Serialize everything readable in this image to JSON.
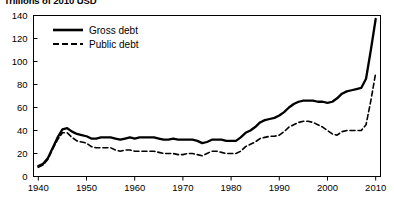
{
  "chart_data": {
    "type": "line",
    "title": "Trillions of 2010 USD",
    "xlabel": "",
    "ylabel": "",
    "xlim": [
      1939,
      2011
    ],
    "ylim": [
      0,
      140
    ],
    "grid": false,
    "legend_position": "top-left-inside",
    "x_ticks": [
      "1940",
      "1950",
      "1960",
      "1970",
      "1980",
      "1990",
      "2000",
      "2010"
    ],
    "x_tick_values": [
      1940,
      1950,
      1960,
      1970,
      1980,
      1990,
      2000,
      2010
    ],
    "y_ticks": [
      "0",
      "20",
      "40",
      "60",
      "80",
      "100",
      "120",
      "140"
    ],
    "y_tick_values": [
      0,
      20,
      40,
      60,
      80,
      100,
      120,
      140
    ],
    "x": [
      1940,
      1941,
      1942,
      1943,
      1944,
      1945,
      1946,
      1947,
      1948,
      1949,
      1950,
      1951,
      1952,
      1953,
      1954,
      1955,
      1956,
      1957,
      1958,
      1959,
      1960,
      1961,
      1962,
      1963,
      1964,
      1965,
      1966,
      1967,
      1968,
      1969,
      1970,
      1971,
      1972,
      1973,
      1974,
      1975,
      1976,
      1977,
      1978,
      1979,
      1980,
      1981,
      1982,
      1983,
      1984,
      1985,
      1986,
      1987,
      1988,
      1989,
      1990,
      1991,
      1992,
      1993,
      1994,
      1995,
      1996,
      1997,
      1998,
      1999,
      2000,
      2001,
      2002,
      2003,
      2004,
      2005,
      2006,
      2007,
      2008,
      2009,
      2010
    ],
    "series": [
      {
        "name": "Gross debt",
        "style": "solid",
        "color": "#000000",
        "values": [
          9,
          11,
          16,
          25,
          34,
          41,
          42,
          39,
          37,
          36,
          35,
          33,
          33,
          34,
          34,
          34,
          33,
          32,
          33,
          34,
          33,
          34,
          34,
          34,
          34,
          33,
          32,
          32,
          33,
          32,
          32,
          32,
          32,
          31,
          29,
          30,
          32,
          32,
          32,
          31,
          31,
          31,
          34,
          38,
          40,
          43,
          47,
          49,
          50,
          51,
          53,
          56,
          60,
          63,
          65,
          66,
          66,
          66,
          65,
          65,
          64,
          65,
          68,
          72,
          74,
          75,
          76,
          77,
          85,
          110,
          137
        ]
      },
      {
        "name": "Public debt",
        "style": "dashed",
        "color": "#000000",
        "values": [
          8,
          10,
          15,
          24,
          32,
          38,
          38,
          34,
          31,
          30,
          29,
          26,
          25,
          25,
          25,
          25,
          23,
          22,
          23,
          23,
          22,
          22,
          22,
          22,
          22,
          21,
          20,
          20,
          20,
          19,
          19,
          20,
          20,
          19,
          18,
          20,
          22,
          22,
          21,
          20,
          20,
          20,
          22,
          26,
          28,
          30,
          33,
          34,
          35,
          35,
          36,
          39,
          43,
          45,
          47,
          48,
          48,
          47,
          45,
          43,
          40,
          37,
          36,
          39,
          40,
          40,
          40,
          40,
          45,
          66,
          90
        ]
      }
    ],
    "legend": [
      {
        "label": "Gross debt",
        "style": "solid"
      },
      {
        "label": "Public debt",
        "style": "dashed"
      }
    ]
  }
}
